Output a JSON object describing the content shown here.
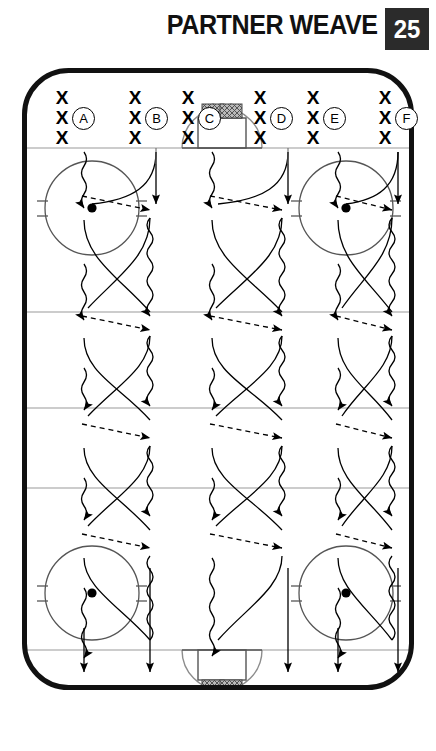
{
  "header": {
    "title": "PARTNER WEAVE",
    "page_number": "25",
    "page_box_color": "#2b2b2b"
  },
  "court": {
    "border_color": "#111111",
    "line_color": "#9a9a9a",
    "mark_color": "#000000",
    "zone_lines_y": [
      80,
      244,
      340,
      420,
      582
    ],
    "lanes_x": [
      68,
      134,
      200,
      266,
      332
    ],
    "groups": [
      {
        "label": "A",
        "x_marks": [
          "X",
          "X",
          "X"
        ],
        "x": 30,
        "y": 20
      },
      {
        "label": "B",
        "x_marks": [
          "X",
          "X",
          "X"
        ],
        "x": 103,
        "y": 20
      },
      {
        "label": "C",
        "x_marks": [
          "X",
          "X",
          "X"
        ],
        "x": 156,
        "y": 20
      },
      {
        "label": "D",
        "x_marks": [
          "X",
          "X",
          "X"
        ],
        "x": 228,
        "y": 20
      },
      {
        "label": "E",
        "x_marks": [
          "X",
          "X",
          "X"
        ],
        "x": 281,
        "y": 20
      },
      {
        "label": "F",
        "x_marks": [
          "X",
          "X",
          "X"
        ],
        "x": 353,
        "y": 20
      }
    ],
    "jump_circles": [
      {
        "cx": 70,
        "cy": 140,
        "r": 47
      },
      {
        "cx": 324,
        "cy": 140,
        "r": 47
      },
      {
        "cx": 70,
        "cy": 525,
        "r": 47
      },
      {
        "cx": 324,
        "cy": 525,
        "r": 47
      }
    ],
    "hoops": [
      {
        "cx": 200,
        "cy": 80,
        "orientation": "top"
      },
      {
        "cx": 200,
        "cy": 582,
        "orientation": "bottom"
      }
    ],
    "legend_semantics": {
      "wavy_line": "dribble-path",
      "solid_curve": "cut-path",
      "dashed_arrow": "pass-path"
    }
  }
}
